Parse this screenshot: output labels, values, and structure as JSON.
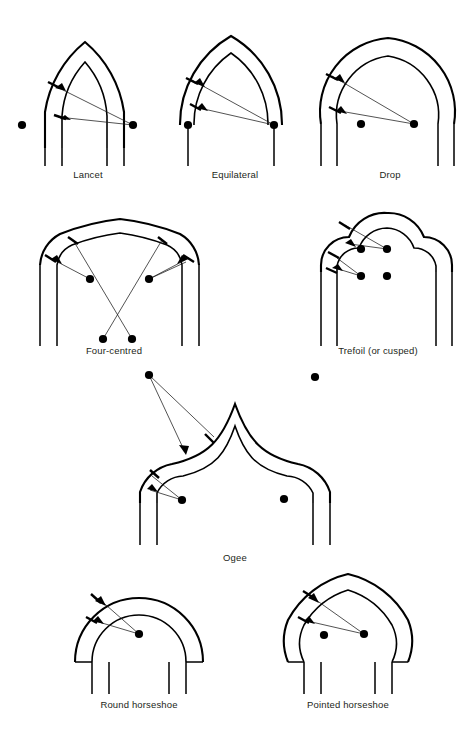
{
  "figure": {
    "background_color": "#ffffff",
    "line_color": "#000000",
    "caption_color": "#231f20"
  },
  "arches": [
    {
      "id": "lancet",
      "label": "Lancet",
      "label_x": 88,
      "label_y": 178,
      "centres": 2,
      "centre_points": [
        [
          22,
          125
        ],
        [
          133,
          125
        ]
      ],
      "note": "Two centres lying outside the span, producing a tall sharply pointed arch"
    },
    {
      "id": "equilateral",
      "label": "Equilateral",
      "label_x": 235,
      "label_y": 178,
      "centres": 2,
      "centre_points": [
        [
          188,
          125
        ],
        [
          274,
          125
        ]
      ],
      "note": "Centres at the opposite springing points; radius equals the span"
    },
    {
      "id": "drop",
      "label": "Drop",
      "label_x": 390,
      "label_y": 178,
      "centres": 2,
      "centre_points": [
        [
          361,
          124
        ],
        [
          414,
          124
        ]
      ],
      "note": "Centres inside the span giving a flatter, dropped point"
    },
    {
      "id": "four-centred",
      "label": "Four-centred",
      "label_x": 114,
      "label_y": 354,
      "centres": 4,
      "centre_points": [
        [
          90,
          279
        ],
        [
          149,
          279
        ],
        [
          103,
          339
        ],
        [
          132,
          339
        ]
      ],
      "note": "Two upper and two lower centres with crossing radii; a flattened Tudor profile"
    },
    {
      "id": "trefoil",
      "label": "Trefoil (or cusped)",
      "label_x": 378,
      "label_y": 354,
      "centres": 4,
      "centre_points": [
        [
          361,
          249
        ],
        [
          387,
          249
        ],
        [
          361,
          276
        ],
        [
          387,
          276
        ]
      ],
      "note": "Three-lobed cusped head struck from four centres"
    },
    {
      "id": "ogee",
      "label": "Ogee",
      "label_x": 235,
      "label_y": 561,
      "centres": 3,
      "centre_points": [
        [
          149,
          375
        ],
        [
          182,
          500
        ],
        [
          284,
          499
        ],
        [
          315,
          377
        ]
      ],
      "note": "Double-curved S profile with low centres inside and high centres outside the span"
    },
    {
      "id": "round-horseshoe",
      "label": "Round horseshoe",
      "label_x": 139,
      "label_y": 708,
      "centres": 1,
      "centre_points": [
        [
          139,
          634
        ]
      ],
      "note": "Single centre raised above the springing so the curve returns inwards"
    },
    {
      "id": "pointed-horseshoe",
      "label": "Pointed horseshoe",
      "label_x": 348,
      "label_y": 708,
      "centres": 2,
      "centre_points": [
        [
          324,
          635
        ],
        [
          364,
          634
        ]
      ],
      "note": "Horseshoe springing combined with a pointed apex struck from two centres"
    }
  ]
}
